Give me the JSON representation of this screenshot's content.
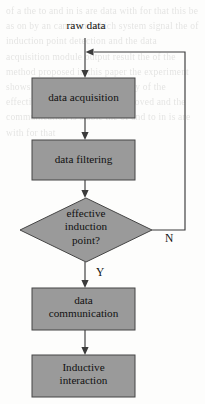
{
  "figure": {
    "type": "flowchart",
    "background_noise_text": "of a the to and in is are data with for that this be as on by an can from which system signal the of induction point detection and the data acquisition module output result the of the method proposed in this paper the experiment shows that the detection accuracy of the effective induction point is improved and the communication is stable the of and to in is are with for that"
  },
  "nodes": [
    {
      "id": "raw-data",
      "shape": "label",
      "lines": [
        "raw data"
      ],
      "x": 56,
      "y": 19,
      "w": 60,
      "h": 16
    },
    {
      "id": "data-acquisition",
      "shape": "rect",
      "lines": [
        "data acquisition"
      ],
      "x": 32,
      "y": 78,
      "w": 103,
      "h": 40
    },
    {
      "id": "data-filtering",
      "shape": "rect",
      "lines": [
        "data filtering"
      ],
      "x": 32,
      "y": 140,
      "w": 103,
      "h": 40
    },
    {
      "id": "effective-induction-point",
      "shape": "diamond",
      "lines": [
        "effective",
        "induction",
        "point?"
      ],
      "x": 20,
      "y": 198,
      "w": 132,
      "h": 64
    },
    {
      "id": "data-communication",
      "shape": "rect",
      "lines": [
        "data",
        "communication"
      ],
      "x": 32,
      "y": 288,
      "w": 103,
      "h": 42
    },
    {
      "id": "inductive-interaction",
      "shape": "rect",
      "lines": [
        "Inductive",
        "interaction"
      ],
      "x": 32,
      "y": 355,
      "w": 103,
      "h": 42
    }
  ],
  "edges": [
    {
      "id": "raw-to-acquisition",
      "from": "raw-data",
      "to": "data-acquisition",
      "label": ""
    },
    {
      "id": "acquisition-to-filtering",
      "from": "data-acquisition",
      "to": "data-filtering",
      "label": ""
    },
    {
      "id": "filtering-to-decision",
      "from": "data-filtering",
      "to": "effective-induction-point",
      "label": ""
    },
    {
      "id": "decision-yes",
      "from": "effective-induction-point",
      "to": "data-communication",
      "label": "Y",
      "label_x": 96,
      "label_y": 266
    },
    {
      "id": "decision-no-feedback",
      "from": "effective-induction-point",
      "to": "data-acquisition",
      "label": "N",
      "label_x": 165,
      "label_y": 232
    },
    {
      "id": "communication-to-interaction",
      "from": "data-communication",
      "to": "inductive-interaction",
      "label": ""
    }
  ],
  "colors": {
    "node_fill": "#9a9a9a",
    "node_stroke": "#454545",
    "line": "#3b3b3b",
    "text": "#111111",
    "page": "#fdfdfc"
  }
}
